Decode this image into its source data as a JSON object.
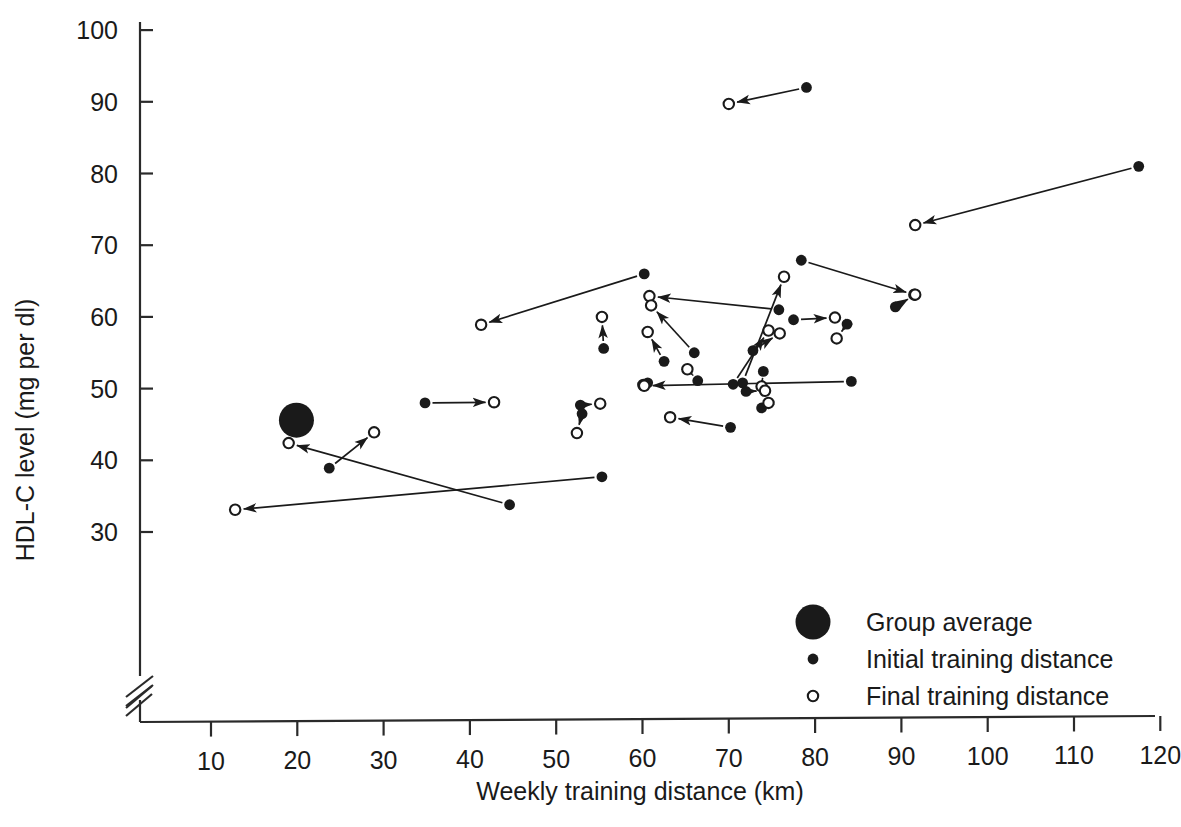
{
  "chart_data": {
    "type": "scatter",
    "title": "",
    "xlabel": "Weekly training distance (km)",
    "ylabel": "HDL-C level (mg per dl)",
    "xlim": [
      0,
      125
    ],
    "ylim": [
      28,
      101
    ],
    "xticks": [
      10,
      20,
      30,
      40,
      50,
      60,
      70,
      80,
      90,
      100,
      110,
      120
    ],
    "yticks": [
      30,
      40,
      50,
      60,
      70,
      80,
      90,
      100
    ],
    "xtick_labels": [
      "10",
      "20",
      "30",
      "40",
      "50",
      "60",
      "70",
      "80",
      "90",
      "100",
      "110",
      "120"
    ],
    "ytick_labels": [
      "30",
      "40",
      "50",
      "60",
      "70",
      "80",
      "90",
      "100"
    ],
    "grid": false,
    "axis_break_x": true,
    "axis_break_y": true,
    "legend_position": "bottom-right",
    "series": [
      {
        "name": "Group average",
        "marker": "large-filled-circle",
        "values": [
          [
            19.9,
            45.6
          ]
        ]
      },
      {
        "name": "Initial training distance",
        "marker": "filled-dot"
      },
      {
        "name": "Final training distance",
        "marker": "open-circle"
      }
    ],
    "pairs": [
      {
        "initial": [
          79.0,
          92.0
        ],
        "final": [
          70.0,
          89.7
        ]
      },
      {
        "initial": [
          117.5,
          81.0
        ],
        "final": [
          91.6,
          72.8
        ]
      },
      {
        "initial": [
          60.2,
          66.0
        ],
        "final": [
          41.3,
          58.9
        ]
      },
      {
        "initial": [
          78.4,
          67.9
        ],
        "final": [
          91.5,
          63.1
        ]
      },
      {
        "initial": [
          89.3,
          61.4
        ],
        "final": [
          91.6,
          63.1
        ]
      },
      {
        "initial": [
          55.5,
          55.6
        ],
        "final": [
          55.3,
          60.0
        ]
      },
      {
        "initial": [
          75.8,
          61.0
        ],
        "final": [
          60.8,
          62.9
        ]
      },
      {
        "initial": [
          66.0,
          55.0
        ],
        "final": [
          61.0,
          61.6
        ]
      },
      {
        "initial": [
          62.5,
          53.8
        ],
        "final": [
          60.6,
          57.9
        ]
      },
      {
        "initial": [
          77.5,
          59.6
        ],
        "final": [
          82.3,
          59.9
        ]
      },
      {
        "initial": [
          83.7,
          59.0
        ],
        "final": [
          82.5,
          57.0
        ]
      },
      {
        "initial": [
          72.8,
          55.3
        ],
        "final": [
          75.9,
          57.7
        ]
      },
      {
        "initial": [
          66.4,
          51.1
        ],
        "final": [
          65.2,
          52.7
        ]
      },
      {
        "initial": [
          70.5,
          50.6
        ],
        "final": [
          74.6,
          58.1
        ]
      },
      {
        "initial": [
          60.6,
          50.8
        ],
        "final": [
          60.1,
          50.5
        ]
      },
      {
        "initial": [
          71.6,
          50.8
        ],
        "final": [
          76.4,
          65.6
        ]
      },
      {
        "initial": [
          74.0,
          52.4
        ],
        "final": [
          73.8,
          50.3
        ]
      },
      {
        "initial": [
          72.0,
          49.6
        ],
        "final": [
          74.2,
          49.7
        ]
      },
      {
        "initial": [
          34.8,
          48.0
        ],
        "final": [
          42.8,
          48.1
        ]
      },
      {
        "initial": [
          52.8,
          47.7
        ],
        "final": [
          55.1,
          47.9
        ]
      },
      {
        "initial": [
          53.0,
          46.5
        ],
        "final": [
          52.4,
          43.8
        ]
      },
      {
        "initial": [
          84.2,
          51.0
        ],
        "final": [
          60.2,
          50.4
        ]
      },
      {
        "initial": [
          70.2,
          44.6
        ],
        "final": [
          63.2,
          46.0
        ]
      },
      {
        "initial": [
          73.8,
          47.3
        ],
        "final": [
          74.6,
          48.0
        ]
      },
      {
        "initial": [
          23.7,
          38.9
        ],
        "final": [
          28.9,
          43.9
        ]
      },
      {
        "initial": [
          44.6,
          33.8
        ],
        "final": [
          19.0,
          42.4
        ]
      },
      {
        "initial": [
          55.3,
          37.7
        ],
        "final": [
          12.8,
          33.1
        ]
      }
    ]
  },
  "legend": {
    "entries": [
      {
        "label": "Group average",
        "marker": "large-filled-circle"
      },
      {
        "label": "Initial training distance",
        "marker": "filled-dot"
      },
      {
        "label": "Final training distance",
        "marker": "open-circle"
      }
    ]
  },
  "colors": {
    "ink": "#1a1a1a",
    "axis": "#2a2a2a",
    "background": "#ffffff"
  }
}
